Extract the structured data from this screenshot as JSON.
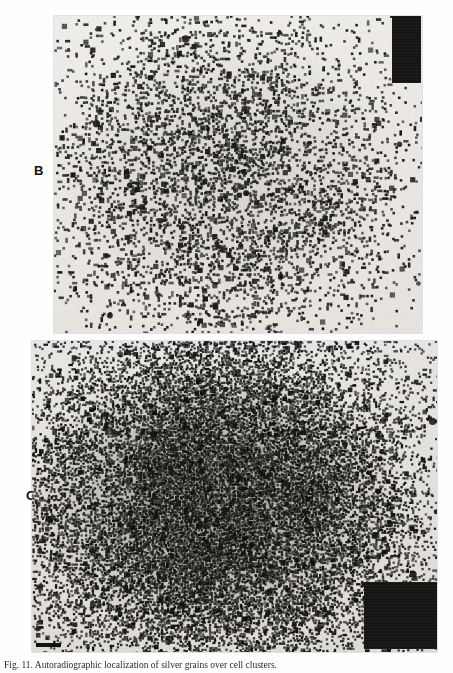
{
  "figure": {
    "caption": "Fig. 11. Autoradiographic localization of silver grains over cell clusters.",
    "media_type": "grayscale photomicrograph autoradiograph",
    "panel_count": 2
  },
  "panels": [
    {
      "id": "B",
      "label": "B",
      "description": "Autoradiograph with moderate silver-grain density forming a diffuse round cluster over a light film background",
      "grain_density_percent": 14,
      "background_hex": "#eae8e4",
      "grain_hex": "#1b1a18",
      "frame": {
        "x": 54,
        "y": 16,
        "width": 368,
        "height": 317
      },
      "fiducial_block": {
        "name": "exposure-block",
        "color_hex": "#171513",
        "x": 338,
        "y": 0,
        "width": 29,
        "height": 67,
        "corner": "top-right"
      },
      "scale_bar": null
    },
    {
      "id": "C",
      "label": "C",
      "description": "Autoradiograph with heavy, confluent silver-grain density forming a dense dark cluster",
      "grain_density_percent": 46,
      "background_hex": "#e8e6e1",
      "grain_hex": "#141311",
      "frame": {
        "x": 32,
        "y": 341,
        "width": 405,
        "height": 311
      },
      "fiducial_block": {
        "name": "exposure-block",
        "color_hex": "#171513",
        "x": 332,
        "y": 241,
        "width": 73,
        "height": 67,
        "corner": "bottom-right"
      },
      "scale_bar": {
        "name": "scale-bar",
        "color_hex": "#14120f",
        "length_px": 25,
        "thickness_px": 4,
        "corner": "bottom-left"
      }
    }
  ],
  "page": {
    "background_hex": "#fefefe",
    "width": 453,
    "height": 673
  }
}
